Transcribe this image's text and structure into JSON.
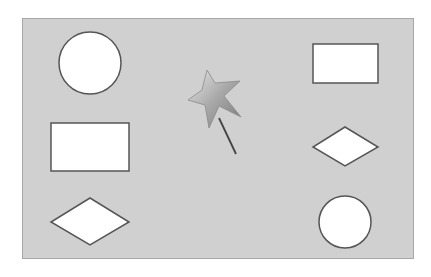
{
  "canvas": {
    "background": "#d0d0d0",
    "border": "#a8a8a8",
    "x": 22,
    "y": 18,
    "width": 392,
    "height": 241
  },
  "shapes": [
    {
      "type": "circle",
      "cx": 90,
      "cy": 63,
      "r": 31,
      "fill": "#ffffff",
      "stroke": "#555555"
    },
    {
      "type": "rectangle",
      "x": 313,
      "y": 44,
      "width": 65,
      "height": 39,
      "fill": "#ffffff",
      "stroke": "#555555"
    },
    {
      "type": "rectangle",
      "x": 51,
      "y": 123,
      "width": 78,
      "height": 48,
      "fill": "#ffffff",
      "stroke": "#555555"
    },
    {
      "type": "diamond",
      "cx": 345,
      "cy": 147,
      "w": 65,
      "h": 39,
      "fill": "#ffffff",
      "stroke": "#555555"
    },
    {
      "type": "diamond",
      "cx": 90,
      "cy": 222,
      "w": 78,
      "h": 47,
      "fill": "#ffffff",
      "stroke": "#555555"
    },
    {
      "type": "circle",
      "cx": 345,
      "cy": 222,
      "r": 26,
      "fill": "#ffffff",
      "stroke": "#555555"
    }
  ],
  "magic_wand": {
    "icon": "magic-wand-icon",
    "star_color": "#a8a8a8",
    "stick_color": "#444444"
  }
}
